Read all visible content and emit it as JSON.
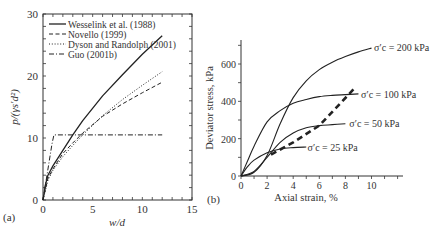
{
  "chart_data": [
    {
      "id": "a",
      "panel_label": "(a)",
      "type": "line",
      "xlabel": "w/d",
      "ylabel": "p/(γs′d²)",
      "xlim": [
        0,
        15
      ],
      "ylim": [
        0,
        30
      ],
      "xticks": [
        "0",
        "5",
        "10",
        "15"
      ],
      "yticks": [
        "0",
        "10",
        "20",
        "30"
      ],
      "legend_position": "upper-left",
      "series": [
        {
          "name": "Wesselink et al. (1988)",
          "style": "solid",
          "x": [
            0,
            0.25,
            0.5,
            1,
            2,
            3,
            4,
            6,
            8,
            10,
            12
          ],
          "y": [
            0,
            2.5,
            4,
            5.5,
            8,
            10.5,
            12.8,
            16.8,
            20.2,
            23.5,
            26.5
          ]
        },
        {
          "name": "Novello (1999)",
          "style": "dashed",
          "x": [
            0,
            0.5,
            1,
            2,
            3,
            4,
            6,
            8,
            10,
            12
          ],
          "y": [
            0,
            3.5,
            5,
            7.5,
            9.2,
            10.8,
            13.5,
            15.5,
            17.3,
            19
          ]
        },
        {
          "name": "Dyson and Randolph (2001)",
          "style": "dotted",
          "x": [
            0,
            0.5,
            1,
            2,
            3,
            4,
            6,
            8,
            10,
            12
          ],
          "y": [
            0,
            3.2,
            4.8,
            7,
            8.8,
            10.5,
            13.6,
            16.2,
            18.5,
            20.7
          ]
        },
        {
          "name": "Guo (2001b)",
          "style": "dash-dot",
          "x": [
            0,
            0.3,
            0.6,
            0.9,
            1.1,
            12
          ],
          "y": [
            0,
            3,
            6,
            9,
            10.5,
            10.5
          ]
        }
      ]
    },
    {
      "id": "b",
      "panel_label": "(b)",
      "type": "line",
      "xlabel": "Axial strain, %",
      "ylabel": "Deviator stress, kPa",
      "xlim": [
        0,
        12.5
      ],
      "ylim": [
        0,
        720
      ],
      "xticks": [
        "0",
        "2",
        "4",
        "6",
        "8",
        "10"
      ],
      "yticks": [
        "0",
        "200",
        "400",
        "600"
      ],
      "series": [
        {
          "name": "σ′c = 200 kPa",
          "style": "solid",
          "x": [
            0,
            1,
            2,
            3,
            4,
            5,
            6,
            7,
            8,
            9,
            10
          ],
          "y": [
            0,
            20,
            110,
            280,
            420,
            510,
            570,
            610,
            640,
            665,
            685
          ]
        },
        {
          "name": "σ′c = 100 kPa",
          "style": "solid",
          "x": [
            0,
            0.5,
            1,
            2,
            3,
            4,
            5,
            6,
            7,
            8,
            9
          ],
          "y": [
            0,
            80,
            160,
            290,
            350,
            390,
            410,
            425,
            432,
            436,
            440
          ]
        },
        {
          "name": "σ′c = 50 kPa",
          "style": "solid",
          "x": [
            0,
            1,
            2,
            3,
            4,
            5,
            6,
            7,
            8
          ],
          "y": [
            0,
            25,
            100,
            180,
            230,
            258,
            270,
            275,
            280
          ]
        },
        {
          "name": "σ′c = 25 kPa",
          "style": "solid",
          "x": [
            0,
            0.5,
            1,
            2,
            3,
            4,
            5
          ],
          "y": [
            0,
            50,
            85,
            125,
            145,
            152,
            155
          ]
        },
        {
          "name": "critical state line",
          "style": "bold-dashed",
          "x": [
            2.3,
            4,
            6,
            8.7
          ],
          "y": [
            115,
            180,
            270,
            470
          ]
        }
      ],
      "annotations": [
        {
          "text": "σ′c = 200 kPa",
          "x": 10.2,
          "y": 690
        },
        {
          "text": "σ′c = 100 kPa",
          "x": 9.2,
          "y": 440
        },
        {
          "text": "σ′c = 50 kPa",
          "x": 8.3,
          "y": 285
        },
        {
          "text": "σ′c = 25 kPa",
          "x": 5.1,
          "y": 155
        }
      ]
    }
  ]
}
